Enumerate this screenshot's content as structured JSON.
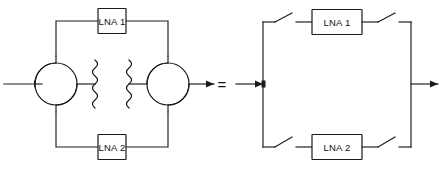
{
  "figure": {
    "equivalence_symbol": "=",
    "background_color": "#ffffff",
    "line_color": "#1a1a1a"
  },
  "left_circuit": {
    "name": "balanced-amplifier-with-hybrid-couplers",
    "amplifiers": [
      {
        "label": "LNA 1",
        "position": "top"
      },
      {
        "label": "LNA 2",
        "position": "bottom"
      }
    ],
    "couplers": [
      {
        "name": "input-hybrid-coupler",
        "symbol": "quadrature-hybrid",
        "position": "left"
      },
      {
        "name": "output-hybrid-coupler",
        "symbol": "quadrature-hybrid",
        "position": "right"
      }
    ],
    "terminations": [
      {
        "name": "isolation-load-left",
        "symbol": "squiggle-termination"
      },
      {
        "name": "isolation-load-right",
        "symbol": "squiggle-termination"
      }
    ],
    "ports": [
      {
        "name": "input-port",
        "direction": "in",
        "side": "left"
      },
      {
        "name": "output-port",
        "direction": "out",
        "side": "right"
      }
    ]
  },
  "right_circuit": {
    "name": "switched-amplifier-equivalent",
    "amplifiers": [
      {
        "label": "LNA 1",
        "position": "top"
      },
      {
        "label": "LNA 2",
        "position": "bottom"
      }
    ],
    "switches": [
      {
        "name": "switch-top-left",
        "state": "open"
      },
      {
        "name": "switch-top-right",
        "state": "open"
      },
      {
        "name": "switch-bottom-left",
        "state": "open"
      },
      {
        "name": "switch-bottom-right",
        "state": "open"
      }
    ],
    "ports": [
      {
        "name": "input-port",
        "direction": "in",
        "side": "left"
      },
      {
        "name": "output-port",
        "direction": "out",
        "side": "right"
      }
    ]
  }
}
